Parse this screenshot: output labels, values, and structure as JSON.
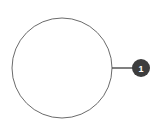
{
  "canvas": {
    "width": 160,
    "height": 129,
    "background_color": "#ffffff"
  },
  "diagram": {
    "name": "numbered-callout-on-circle",
    "shape": {
      "kind": "circle-outline",
      "center_x": 62,
      "center_y": 68,
      "radius": 50,
      "stroke_color": "#6b6b6b",
      "stroke_width": 1,
      "fill": "none"
    },
    "leader_line": {
      "x1": 112,
      "y1": 68,
      "x2": 133,
      "y2": 68,
      "stroke_color": "#4a4a4a",
      "stroke_width": 1.4
    },
    "callouts": [
      {
        "label": "1",
        "center_x": 141,
        "center_y": 68,
        "radius": 9,
        "fill_color": "#3d3d3d",
        "text_color": "#ffffff"
      }
    ]
  }
}
